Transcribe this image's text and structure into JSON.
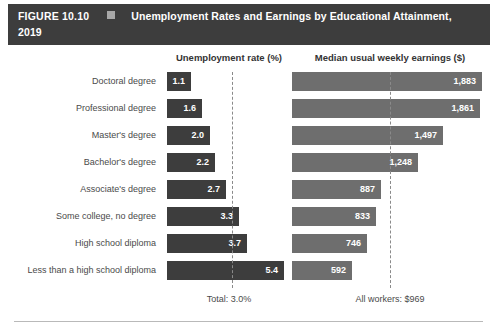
{
  "header": {
    "figure_number": "FIGURE 10.10",
    "square_icon": "square-bullet-icon",
    "title_line1": "Unemployment Rates and Earnings by Educational Attainment,",
    "title_line2": "2019",
    "bar_color": "#3d3d3d",
    "square_color": "#a8a8a8"
  },
  "columns": {
    "unemployment_heading": "Unemployment rate (%)",
    "earnings_heading": "Median usual weekly earnings ($)"
  },
  "footers": {
    "unemployment_total": "Total: 3.0%",
    "earnings_total": "All workers: $969"
  },
  "chart_data": {
    "type": "bar",
    "title": "Unemployment Rates and Earnings by Educational Attainment, 2019",
    "orientation": "horizontal",
    "grid": false,
    "legend": "none",
    "categories": [
      "Doctoral degree",
      "Professional degree",
      "Master's degree",
      "Bachelor's degree",
      "Associate's degree",
      "Some college, no degree",
      "High school diploma",
      "Less than a high school diploma"
    ],
    "series": [
      {
        "name": "Unemployment rate (%)",
        "xlabel": "Unemployment rate (%)",
        "values": [
          1.1,
          1.6,
          2.0,
          2.2,
          2.7,
          3.3,
          3.7,
          5.4
        ],
        "labels": [
          "1.1",
          "1.6",
          "2.0",
          "2.2",
          "2.7",
          "3.3",
          "3.7",
          "5.4"
        ],
        "xlim": [
          0,
          6.0
        ],
        "reference_line": 3.0,
        "reference_label": "Total: 3.0%",
        "color": "#3d3d3d"
      },
      {
        "name": "Median usual weekly earnings ($)",
        "xlabel": "Median usual weekly earnings ($)",
        "values": [
          1883,
          1861,
          1497,
          1248,
          887,
          833,
          746,
          592
        ],
        "labels": [
          "1,883",
          "1,861",
          "1,497",
          "1,248",
          "887",
          "833",
          "746",
          "592"
        ],
        "xlim": [
          0,
          2000
        ],
        "reference_line": 969,
        "reference_label": "All workers: $969",
        "color": "#6e6e6e"
      }
    ]
  }
}
